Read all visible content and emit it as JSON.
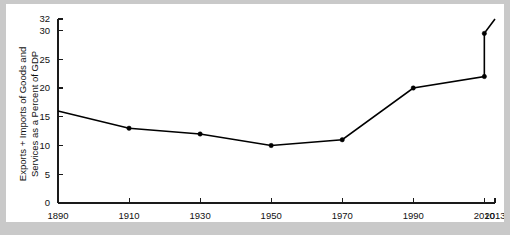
{
  "chart_data": {
    "type": "line",
    "title": "",
    "xlabel": "",
    "ylabel_line1": "Exports + Imports of Goods and",
    "ylabel_line2": "Services as a Percent of GDP",
    "ylabel": "Exports + Imports of Goods and Services as a Percent of GDP",
    "x": [
      1890,
      1910,
      1930,
      1950,
      1970,
      1990,
      2010,
      2010,
      2013
    ],
    "values": [
      16,
      13,
      12,
      10,
      11,
      20,
      22,
      29.5,
      32
    ],
    "points": [
      {
        "x": 1890,
        "y": 16,
        "marker": false
      },
      {
        "x": 1910,
        "y": 13,
        "marker": true
      },
      {
        "x": 1930,
        "y": 12,
        "marker": true
      },
      {
        "x": 1950,
        "y": 10,
        "marker": true
      },
      {
        "x": 1970,
        "y": 11,
        "marker": true
      },
      {
        "x": 1990,
        "y": 20,
        "marker": true
      },
      {
        "x": 2010,
        "y": 22,
        "marker": true
      },
      {
        "x": 2010,
        "y": 29.5,
        "marker": true
      },
      {
        "x": 2013,
        "y": 32,
        "marker": false
      }
    ],
    "xticks": [
      1890,
      1910,
      1930,
      1950,
      1970,
      1990,
      2010,
      2013
    ],
    "xtick_labels": [
      "1890",
      "1910",
      "1930",
      "1950",
      "1970",
      "1990",
      "2010",
      "2013"
    ],
    "yticks": [
      0,
      5,
      10,
      15,
      20,
      25,
      30,
      32
    ],
    "ytick_labels": [
      "0",
      "5",
      "10",
      "15",
      "20",
      "25",
      "30",
      "32"
    ],
    "xlim": [
      1890,
      2013
    ],
    "ylim": [
      0,
      32
    ],
    "grid": false,
    "legend": false,
    "legend_position": "none",
    "series": [
      {
        "name": "Exports + Imports of Goods and Services as a Percent of GDP",
        "color": "#000000",
        "values": [
          16,
          13,
          12,
          10,
          11,
          20,
          22,
          29.5,
          32
        ]
      }
    ],
    "colors": {
      "line": "#000000",
      "axis": "#1a1a1a",
      "text": "#111111",
      "plot_background": "#ffffff",
      "page_background": "#c9c9c9"
    }
  }
}
